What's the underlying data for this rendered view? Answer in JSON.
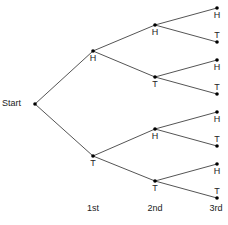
{
  "diagram": {
    "type": "probability-tree",
    "root_label": "Start",
    "levels": [
      "1st",
      "2nd",
      "3rd"
    ],
    "nodes": {
      "start": {
        "label": "Start",
        "x": 35,
        "y": 104
      },
      "l1": [
        {
          "label": "H",
          "x": 93,
          "y": 51
        },
        {
          "label": "T",
          "x": 93,
          "y": 156
        }
      ],
      "l2": [
        {
          "label": "H",
          "x": 155,
          "y": 25
        },
        {
          "label": "T",
          "x": 155,
          "y": 77
        },
        {
          "label": "H",
          "x": 155,
          "y": 129
        },
        {
          "label": "T",
          "x": 155,
          "y": 181
        }
      ],
      "l3": [
        {
          "label": "H",
          "x": 217,
          "y": 8
        },
        {
          "label": "T",
          "x": 217,
          "y": 42
        },
        {
          "label": "H",
          "x": 217,
          "y": 60
        },
        {
          "label": "T",
          "x": 217,
          "y": 94
        },
        {
          "label": "H",
          "x": 217,
          "y": 112
        },
        {
          "label": "T",
          "x": 217,
          "y": 146
        },
        {
          "label": "H",
          "x": 217,
          "y": 164
        },
        {
          "label": "T",
          "x": 217,
          "y": 198
        }
      ]
    },
    "colors": {
      "line": "#555555",
      "dot": "#000000",
      "text": "#222222"
    }
  }
}
